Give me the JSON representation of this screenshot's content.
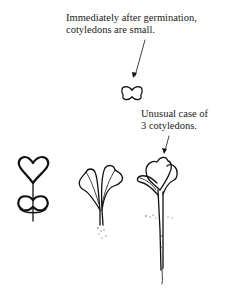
{
  "annotations": {
    "germination_note": {
      "line1": "Immediately after germination,",
      "line2": "cotyledons are small."
    },
    "three_cotyledons_note": {
      "line1": "Unusual case of",
      "line2": "3 cotyledons."
    }
  },
  "figures": [
    {
      "name": "tiny-seedling",
      "description": "Small cotyledon pair immediately after germination"
    },
    {
      "name": "seedling-with-seed-coat",
      "description": "Heart-shaped cotyledons emerging above seed coat"
    },
    {
      "name": "seedling-two-cotyledons",
      "description": "Seedling with two open cotyledons and small roots"
    },
    {
      "name": "seedling-three-cotyledons",
      "description": "Taller seedling with three cotyledons and long root"
    }
  ],
  "colors": {
    "ink": "#111111",
    "background": "#ffffff"
  }
}
